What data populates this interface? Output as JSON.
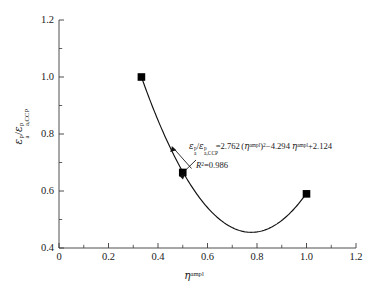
{
  "chart_data": {
    "type": "scatter",
    "title": "",
    "xlabel": "η^ampl",
    "ylabel": "ε_a^p / ε_a,CCP^p",
    "xlim": [
      0,
      1.2
    ],
    "ylim": [
      0.4,
      1.2
    ],
    "xticks": [
      "0",
      "0.2",
      "0.4",
      "0.6",
      "0.8",
      "1.0",
      "1.2"
    ],
    "xtick_values": [
      0,
      0.2,
      0.4,
      0.6,
      0.8,
      1.0,
      1.2
    ],
    "yticks": [
      "0.4",
      "0.6",
      "0.8",
      "1.0",
      "1.2"
    ],
    "ytick_values": [
      0.4,
      0.6,
      0.8,
      1.0,
      1.2
    ],
    "minor_tick_step_x": 0.1,
    "minor_tick_step_y": 0.1,
    "grid": false,
    "legend": false,
    "marker": "filled-square",
    "marker_color": "#000000",
    "curve_color": "#000000",
    "points": [
      {
        "x": 0.333,
        "y": 1.0
      },
      {
        "x": 0.5,
        "y": 0.665
      },
      {
        "x": 1.0,
        "y": 0.59
      }
    ],
    "fit": {
      "type": "quadratic",
      "a": 2.762,
      "b": -4.294,
      "c": 2.124,
      "x_range": [
        0.333,
        1.0
      ],
      "r_squared": 0.986,
      "vertex_x": 0.777,
      "vertex_y": 0.455
    }
  },
  "axes": {
    "x_tick_labels": [
      "0",
      "0.2",
      "0.4",
      "0.6",
      "0.8",
      "1.0",
      "1.2"
    ],
    "y_tick_labels": [
      "0.4",
      "0.6",
      "0.8",
      "1.0",
      "1.2"
    ]
  },
  "x_axis_title": {
    "symbol": "η",
    "superscript": "ampl"
  },
  "y_axis_title": {
    "numerator_symbol": "ε",
    "numerator_sup": "p",
    "numerator_sub": "a",
    "slash": "/",
    "denominator_symbol": "ε",
    "denominator_sup": "p",
    "denominator_sub": "a,CCP"
  },
  "annotation": {
    "equation": {
      "lhs_num_symbol": "ε",
      "lhs_num_sup": "p",
      "lhs_num_sub": "a",
      "lhs_slash": "/",
      "lhs_den_symbol": "ε",
      "lhs_den_sup": "p",
      "lhs_den_sub": "a,CCP",
      "equals": "=",
      "coef_quadratic": "2.762",
      "open_paren": "(",
      "eta_symbol": "η",
      "eta_sup": "ampl",
      "close_paren": ")",
      "power": "2",
      "minus": "−",
      "coef_linear": "4.294",
      "plus": "+",
      "constant": "2.124"
    },
    "r_squared": {
      "symbol": "R",
      "power": "2",
      "equals_value": "=0.986"
    }
  }
}
